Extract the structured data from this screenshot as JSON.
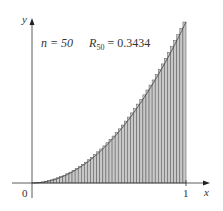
{
  "chart_data": {
    "type": "bar",
    "title": "",
    "annotation": {
      "n_label": "n",
      "n_value": "50",
      "r_label": "R",
      "r_sub": "50",
      "r_value": "0.3434"
    },
    "function": "x^2",
    "n": 50,
    "method": "right endpoint Riemann sum",
    "xlim": [
      0,
      1
    ],
    "ylim": [
      0,
      1
    ],
    "xlabel": "x",
    "ylabel": "y",
    "x_ticks": [
      "0",
      "1"
    ],
    "grid": false,
    "bar_color": "#c8c8c8",
    "edge_color": "#555555",
    "rects": {
      "left_endpoints_step": 0.02,
      "heights_rule": "((i+1)/50)^2 for i in 0..49"
    },
    "values": [
      0.0004,
      0.0016,
      0.0036,
      0.0064,
      0.01,
      0.0144,
      0.0196,
      0.0256,
      0.0324,
      0.04,
      0.0484,
      0.0576,
      0.0676,
      0.0784,
      0.09,
      0.1024,
      0.1156,
      0.1296,
      0.1444,
      0.16,
      0.1764,
      0.1936,
      0.2116,
      0.2304,
      0.25,
      0.2704,
      0.2916,
      0.3136,
      0.3364,
      0.36,
      0.3844,
      0.4096,
      0.4356,
      0.4624,
      0.49,
      0.5184,
      0.5476,
      0.5776,
      0.6084,
      0.64,
      0.6724,
      0.7056,
      0.7396,
      0.7744,
      0.81,
      0.8464,
      0.8836,
      0.9216,
      0.9604,
      1.0
    ]
  },
  "labels": {
    "origin": "0",
    "x_one": "1",
    "x_axis": "x",
    "y_axis": "y",
    "n_text": "n = 50",
    "r_main": "R",
    "r_sub": "50",
    "r_value": " = 0.3434"
  }
}
